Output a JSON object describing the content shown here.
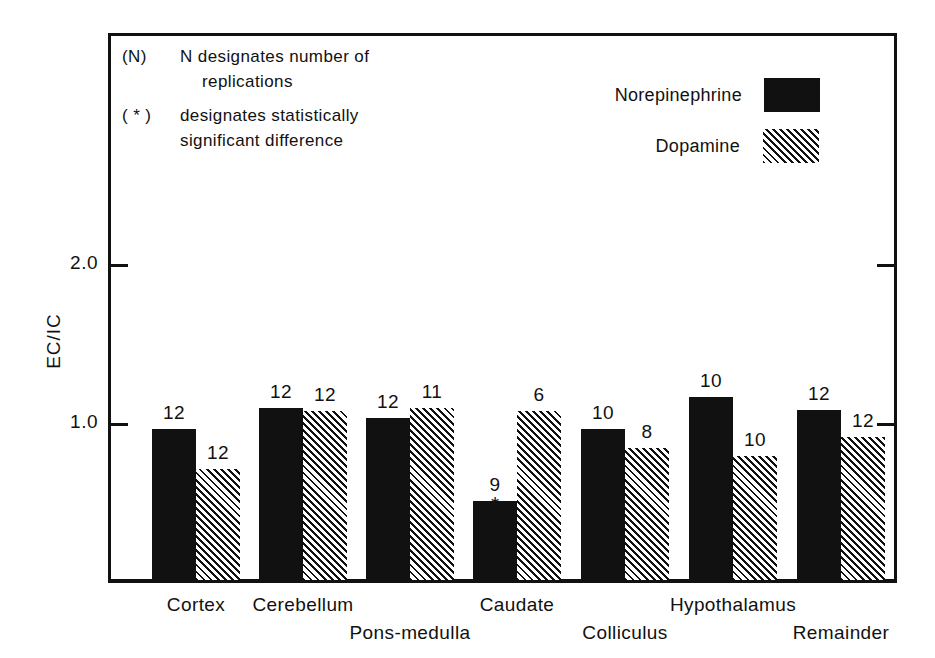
{
  "annotations": [
    {
      "key": "(N)",
      "line1": "N  designates  number  of",
      "line2": "replications"
    },
    {
      "key": "( * )",
      "line1": "designates  statistically",
      "line2": "significant  difference"
    }
  ],
  "legend": [
    {
      "label": "Norepinephrine",
      "swatch": "solid",
      "color": "#111111"
    },
    {
      "label": "Dopamine",
      "swatch": "hatch",
      "color": "#111111"
    }
  ],
  "chart_data": {
    "type": "bar",
    "title": "",
    "xlabel": "",
    "ylabel": "EC/IC",
    "ylim": [
      0,
      2.55
    ],
    "yticks": [
      1.0,
      2.0
    ],
    "ytick_labels": [
      "1.0",
      "2.0"
    ],
    "grid": false,
    "legend_position": "top-right",
    "categories": [
      "Cortex",
      "Cerebellum",
      "Pons-medulla",
      "Caudate",
      "Colliculus",
      "Hypothalamus",
      "Remainder"
    ],
    "series": [
      {
        "name": "Norepinephrine",
        "values": [
          0.95,
          1.08,
          1.02,
          0.5,
          0.95,
          1.15,
          1.07
        ],
        "n": [
          12,
          12,
          12,
          9,
          10,
          10,
          12
        ]
      },
      {
        "name": "Dopamine",
        "values": [
          0.7,
          1.06,
          1.08,
          1.06,
          0.83,
          0.78,
          0.9
        ],
        "n": [
          12,
          12,
          11,
          6,
          8,
          10,
          12
        ]
      }
    ],
    "significance_markers": [
      {
        "category": "Caudate",
        "series": "Norepinephrine",
        "marker": "*"
      }
    ]
  }
}
